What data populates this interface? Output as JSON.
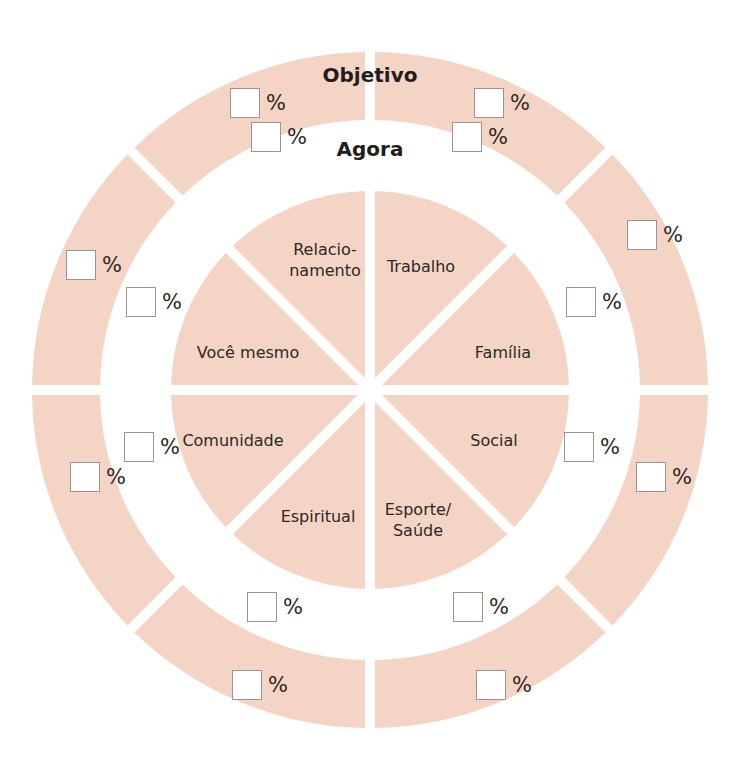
{
  "colors": {
    "segment_fill": "#f4d5c5",
    "background": "#ffffff",
    "box_border": "#9a9494",
    "text": "#2e2723"
  },
  "center": {
    "x": 370,
    "y": 390
  },
  "rings": {
    "outer": {
      "title": "Objetivo",
      "outer_radius": 338,
      "inner_radius": 270
    },
    "inner": {
      "title": "Agora"
    },
    "pie": {
      "radius": 199
    }
  },
  "segments": [
    {
      "label": "Trabalho",
      "pos": {
        "x": 421,
        "y": 266
      }
    },
    {
      "label": "Família",
      "pos": {
        "x": 503,
        "y": 352
      }
    },
    {
      "label": "Social",
      "pos": {
        "x": 494,
        "y": 440
      }
    },
    {
      "label": "Esporte/\nSaúde",
      "pos": {
        "x": 418,
        "y": 520
      }
    },
    {
      "label": "Espiritual",
      "pos": {
        "x": 318,
        "y": 516
      }
    },
    {
      "label": "Comunidade",
      "pos": {
        "x": 233,
        "y": 440
      }
    },
    {
      "label": "Você mesmo",
      "pos": {
        "x": 248,
        "y": 352
      }
    },
    {
      "label": "Relacio-\nnamento",
      "pos": {
        "x": 325,
        "y": 260
      }
    }
  ],
  "percent_sign": "%",
  "objetivo_inputs": [
    {
      "segment": "Relacionamento",
      "x": 230,
      "y": 88,
      "value": ""
    },
    {
      "segment": "Trabalho",
      "x": 474,
      "y": 88,
      "value": ""
    },
    {
      "segment": "Família",
      "x": 627,
      "y": 220,
      "value": ""
    },
    {
      "segment": "Social",
      "x": 636,
      "y": 462,
      "value": ""
    },
    {
      "segment": "Esporte/Saúde",
      "x": 476,
      "y": 670,
      "value": ""
    },
    {
      "segment": "Espiritual",
      "x": 232,
      "y": 670,
      "value": ""
    },
    {
      "segment": "Comunidade",
      "x": 70,
      "y": 462,
      "value": ""
    },
    {
      "segment": "Você mesmo",
      "x": 66,
      "y": 250,
      "value": ""
    }
  ],
  "agora_inputs": [
    {
      "segment": "Relacionamento",
      "x": 251,
      "y": 122,
      "value": ""
    },
    {
      "segment": "Trabalho",
      "x": 452,
      "y": 122,
      "value": ""
    },
    {
      "segment": "Família",
      "x": 566,
      "y": 287,
      "value": ""
    },
    {
      "segment": "Social",
      "x": 564,
      "y": 432,
      "value": ""
    },
    {
      "segment": "Esporte/Saúde",
      "x": 453,
      "y": 592,
      "value": ""
    },
    {
      "segment": "Espiritual",
      "x": 247,
      "y": 592,
      "value": ""
    },
    {
      "segment": "Comunidade",
      "x": 124,
      "y": 432,
      "value": ""
    },
    {
      "segment": "Você mesmo",
      "x": 126,
      "y": 287,
      "value": ""
    }
  ],
  "titles": {
    "objetivo": {
      "text": "Objetivo",
      "x": 370,
      "y": 75
    },
    "agora": {
      "text": "Agora",
      "x": 370,
      "y": 149
    }
  }
}
